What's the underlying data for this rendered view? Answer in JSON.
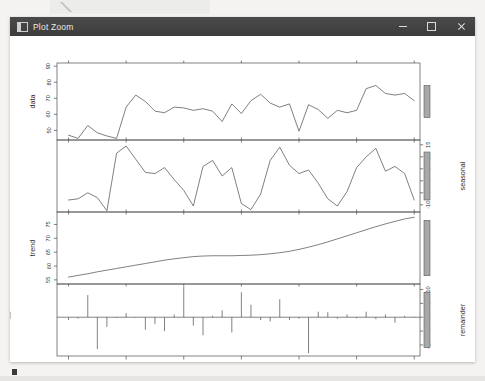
{
  "window": {
    "title": "Plot Zoom",
    "icon": "plot-window-icon",
    "controls": {
      "minimize_label": "–",
      "maximize_label": "□",
      "close_label": "✕"
    }
  },
  "chart_data": {
    "type": "line",
    "title": "",
    "subtitle": "",
    "xlabel": "time",
    "ylabel": "",
    "grid": false,
    "legend": null,
    "xlim": [
      2015.9,
      2019.05
    ],
    "xticks": [
      "2016.0",
      "2016.5",
      "2017.0",
      "2017.5",
      "2018.0",
      "2018.5",
      "2019.0"
    ],
    "xtick_values": [
      2016.0,
      2016.5,
      2017.0,
      2017.5,
      2018.0,
      2018.5,
      2019.0
    ],
    "x": [
      2016.0,
      2016.083,
      2016.167,
      2016.25,
      2016.333,
      2016.417,
      2016.5,
      2016.583,
      2016.667,
      2016.75,
      2016.833,
      2016.917,
      2017.0,
      2017.083,
      2017.167,
      2017.25,
      2017.333,
      2017.417,
      2017.5,
      2017.583,
      2017.667,
      2017.75,
      2017.833,
      2017.917,
      2018.0,
      2018.083,
      2018.167,
      2018.25,
      2018.333,
      2018.417,
      2018.5,
      2018.583,
      2018.667,
      2018.75,
      2018.833,
      2018.917,
      2019.0
    ],
    "panels": [
      {
        "name": "data",
        "label": "data",
        "axis_side": "left",
        "yticks": [
          "50",
          "60",
          "70",
          "80",
          "90"
        ],
        "ytick_values": [
          50,
          60,
          70,
          80,
          90
        ],
        "ylim": [
          44,
          92
        ],
        "plot_type": "line",
        "values": [
          47.0,
          45.0,
          53.0,
          48.5,
          46.5,
          45.0,
          64.5,
          72.0,
          68.0,
          62.0,
          61.0,
          64.5,
          64.0,
          62.5,
          63.5,
          62.0,
          55.5,
          66.5,
          60.5,
          68.5,
          72.5,
          67.0,
          64.5,
          66.5,
          49.5,
          66.0,
          63.0,
          57.5,
          62.5,
          61.0,
          62.5,
          76.0,
          78.0,
          73.0,
          72.0,
          73.0,
          68.5,
          78.5,
          82.5
        ]
      },
      {
        "name": "seasonal",
        "label": "seasonal",
        "axis_side": "right",
        "yticks": [
          "-10",
          "-5",
          "0",
          "5",
          "10",
          "15"
        ],
        "ytick_values": [
          -10,
          -5,
          0,
          5,
          10,
          15
        ],
        "ylim": [
          -13,
          17
        ],
        "plot_type": "line",
        "values": [
          -8.0,
          -7.5,
          -5.0,
          -7.0,
          -12.5,
          11.5,
          14.5,
          9.0,
          3.5,
          3.0,
          5.5,
          0.5,
          -4.0,
          -10.5,
          6.0,
          8.5,
          2.0,
          5.5,
          -9.5,
          -12.0,
          -5.5,
          8.5,
          14.0,
          6.5,
          3.0,
          4.5,
          -1.0,
          -7.5,
          -10.5,
          -4.5,
          5.5,
          10.0,
          13.5,
          4.0,
          6.0,
          3.0,
          -8.0,
          -10.0,
          6.5
        ]
      },
      {
        "name": "trend",
        "label": "trend",
        "axis_side": "left",
        "yticks": [
          "55",
          "60",
          "65",
          "70",
          "75"
        ],
        "ytick_values": [
          55,
          60,
          65,
          70,
          75
        ],
        "ylim": [
          53.5,
          79.5
        ],
        "plot_type": "line",
        "values": [
          56.0,
          56.6,
          57.2,
          57.9,
          58.5,
          59.1,
          59.7,
          60.3,
          60.9,
          61.5,
          62.1,
          62.6,
          63.0,
          63.4,
          63.6,
          63.7,
          63.7,
          63.7,
          63.8,
          63.9,
          64.1,
          64.4,
          64.8,
          65.3,
          66.0,
          66.8,
          67.7,
          68.7,
          69.8,
          70.9,
          72.0,
          73.1,
          74.2,
          75.2,
          76.1,
          77.0,
          77.6,
          78.0,
          78.3
        ]
      },
      {
        "name": "remainder",
        "label": "remainder",
        "axis_side": "right",
        "yticks": [
          "-10",
          "-5",
          "0",
          "5",
          "10"
        ],
        "ytick_values": [
          -10,
          -5,
          0,
          5,
          10
        ],
        "ylim": [
          -14,
          12
        ],
        "plot_type": "stick",
        "values": [
          -1.0,
          -0.5,
          8.0,
          -11.5,
          -3.5,
          -0.3,
          1.5,
          -0.2,
          -4.5,
          -2.5,
          -5.0,
          1.0,
          11.0,
          -3.0,
          -6.5,
          0.5,
          2.5,
          -5.5,
          9.0,
          4.5,
          -1.0,
          -1.5,
          6.5,
          -1.0,
          -0.5,
          -13.0,
          2.0,
          1.8,
          -0.5,
          1.0,
          -0.4,
          2.0,
          -0.7,
          1.0,
          -2.0,
          0.5,
          0.2,
          2.0,
          -0.6
        ]
      }
    ]
  }
}
